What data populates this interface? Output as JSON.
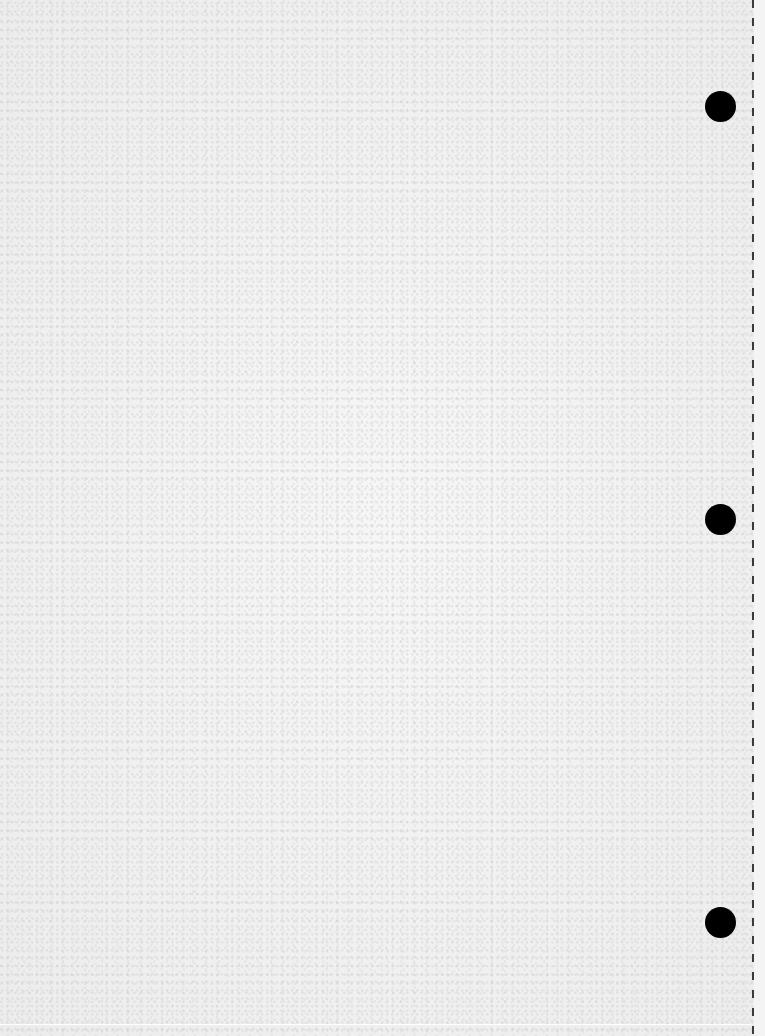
{
  "page": {
    "type": "blank-loose-leaf-sheet",
    "background_color": "#f2f2f2",
    "text": ""
  },
  "punch_holes": [
    {
      "name": "top",
      "center_x": 720,
      "center_y": 106,
      "diameter": 31,
      "color": "#000000"
    },
    {
      "name": "middle",
      "center_x": 720,
      "center_y": 519,
      "diameter": 31,
      "color": "#000000"
    },
    {
      "name": "bottom",
      "center_x": 720,
      "center_y": 922,
      "diameter": 31,
      "color": "#000000"
    }
  ],
  "perforation": {
    "x": 753,
    "style": "dashed",
    "color": "#3a3a3a"
  }
}
